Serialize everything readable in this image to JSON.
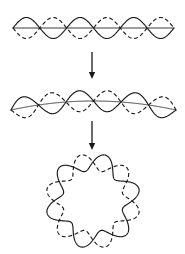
{
  "figure": {
    "background_color": "#ffffff",
    "stroke_color": "#1a1a1a",
    "width": 185,
    "height": 254
  },
  "panels": [
    {
      "id": "panel-straight",
      "label": "Straight standing wave",
      "geometry": "linear",
      "center_y": 28,
      "x_start": 13,
      "x_end": 174,
      "amplitude": 10.5,
      "cycles": 3,
      "has_axis": true,
      "curves": [
        {
          "name": "solid-wave",
          "style": "solid",
          "phase_deg": 0
        },
        {
          "name": "dashed-wave",
          "style": "dashed",
          "phase_deg": 180
        }
      ]
    },
    {
      "id": "panel-bent",
      "label": "Bent standing wave",
      "geometry": "arc",
      "center_y": 101,
      "x_start": 11,
      "x_end": 176,
      "amplitude": 10.5,
      "cycles": 3,
      "arc_sagitta": 9,
      "has_axis": true,
      "curves": [
        {
          "name": "solid-wave",
          "style": "solid",
          "phase_deg": 0
        },
        {
          "name": "dashed-wave",
          "style": "dashed",
          "phase_deg": 180
        }
      ]
    },
    {
      "id": "panel-ring",
      "label": "Closed ring standing wave",
      "geometry": "polar",
      "center_x": 93,
      "center_y": 201,
      "mean_radius": 39,
      "amplitude": 8.5,
      "lobes": 6,
      "has_axis": false,
      "curves": [
        {
          "name": "solid-wave",
          "style": "solid",
          "phase_deg": 0
        },
        {
          "name": "dashed-wave",
          "style": "dashed",
          "phase_deg": 180
        }
      ]
    }
  ],
  "arrows": [
    {
      "id": "arrow-one",
      "label": "transform to bent wave",
      "direction": "down",
      "x": 92,
      "y_start": 52,
      "y_end": 79
    },
    {
      "id": "arrow-two",
      "label": "transform to closed ring",
      "direction": "down",
      "x": 92,
      "y_start": 121,
      "y_end": 150
    }
  ]
}
